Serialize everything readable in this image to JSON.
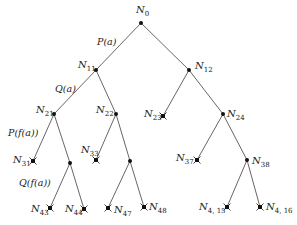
{
  "nodes": [
    {
      "id": "N0",
      "name": "N",
      "sub": "0",
      "x": 141,
      "y": 23,
      "type": "internal",
      "lx": 136,
      "ly": 13,
      "anchor": "middle"
    },
    {
      "id": "N11",
      "name": "N",
      "sub": "11",
      "x": 96,
      "y": 70,
      "type": "internal",
      "lx": 78,
      "ly": 68,
      "anchor": "start"
    },
    {
      "id": "N12",
      "name": "N",
      "sub": "12",
      "x": 189,
      "y": 70,
      "type": "internal",
      "lx": 195,
      "ly": 69,
      "anchor": "start"
    },
    {
      "id": "N21",
      "name": "N",
      "sub": "21",
      "x": 54,
      "y": 114,
      "type": "internal",
      "lx": 36,
      "ly": 113,
      "anchor": "start"
    },
    {
      "id": "N22",
      "name": "N",
      "sub": "22",
      "x": 116,
      "y": 114,
      "type": "internal",
      "lx": 96,
      "ly": 113,
      "anchor": "start"
    },
    {
      "id": "N23",
      "name": "N",
      "sub": "23",
      "x": 163,
      "y": 116,
      "type": "failure",
      "lx": 144,
      "ly": 117,
      "anchor": "start"
    },
    {
      "id": "N24",
      "name": "N",
      "sub": "24",
      "x": 223,
      "y": 114,
      "type": "internal",
      "lx": 227,
      "ly": 117,
      "anchor": "start"
    },
    {
      "id": "N31",
      "name": "N",
      "sub": "31",
      "x": 33,
      "y": 161,
      "type": "failure",
      "lx": 13,
      "ly": 163,
      "anchor": "start"
    },
    {
      "id": "N32",
      "name": "",
      "sub": "",
      "x": 70,
      "y": 163,
      "type": "internal",
      "lx": 0,
      "ly": 0,
      "anchor": "start"
    },
    {
      "id": "N33",
      "name": "N",
      "sub": "33",
      "x": 96,
      "y": 160,
      "type": "failure",
      "lx": 81,
      "ly": 153,
      "anchor": "start"
    },
    {
      "id": "N34",
      "name": "",
      "sub": "",
      "x": 130,
      "y": 161,
      "type": "internal",
      "lx": 0,
      "ly": 0,
      "anchor": "start"
    },
    {
      "id": "N37",
      "name": "N",
      "sub": "37",
      "x": 197,
      "y": 160,
      "type": "failure",
      "lx": 176,
      "ly": 161,
      "anchor": "start"
    },
    {
      "id": "N38",
      "name": "N",
      "sub": "38",
      "x": 247,
      "y": 160,
      "type": "internal",
      "lx": 252,
      "ly": 164,
      "anchor": "start"
    },
    {
      "id": "N43",
      "name": "N",
      "sub": "43",
      "x": 50,
      "y": 208,
      "type": "failure",
      "lx": 31,
      "ly": 212,
      "anchor": "start"
    },
    {
      "id": "N44",
      "name": "N",
      "sub": "44",
      "x": 84,
      "y": 209,
      "type": "failure",
      "lx": 65,
      "ly": 212,
      "anchor": "start"
    },
    {
      "id": "N47",
      "name": "N",
      "sub": "47",
      "x": 108,
      "y": 208,
      "type": "failure",
      "lx": 114,
      "ly": 213,
      "anchor": "start"
    },
    {
      "id": "N48",
      "name": "N",
      "sub": "48",
      "x": 144,
      "y": 207,
      "type": "failure",
      "lx": 149,
      "ly": 210,
      "anchor": "start"
    },
    {
      "id": "N415",
      "name": "N",
      "sub": "4, 15",
      "x": 227,
      "y": 207,
      "type": "failure",
      "lx": 199,
      "ly": 210,
      "anchor": "start"
    },
    {
      "id": "N416",
      "name": "N",
      "sub": "4, 16",
      "x": 260,
      "y": 207,
      "type": "failure",
      "lx": 266,
      "ly": 210,
      "anchor": "start"
    }
  ],
  "edges": [
    {
      "from": "N0",
      "to": "N11"
    },
    {
      "from": "N0",
      "to": "N12"
    },
    {
      "from": "N11",
      "to": "N21"
    },
    {
      "from": "N11",
      "to": "N22"
    },
    {
      "from": "N12",
      "to": "N23"
    },
    {
      "from": "N12",
      "to": "N24"
    },
    {
      "from": "N21",
      "to": "N31"
    },
    {
      "from": "N21",
      "to": "N32"
    },
    {
      "from": "N22",
      "to": "N33"
    },
    {
      "from": "N22",
      "to": "N34"
    },
    {
      "from": "N24",
      "to": "N37"
    },
    {
      "from": "N24",
      "to": "N38"
    },
    {
      "from": "N32",
      "to": "N43"
    },
    {
      "from": "N32",
      "to": "N44"
    },
    {
      "from": "N34",
      "to": "N47"
    },
    {
      "from": "N34",
      "to": "N48"
    },
    {
      "from": "N38",
      "to": "N415"
    },
    {
      "from": "N38",
      "to": "N416"
    }
  ],
  "edge_labels": [
    {
      "text": "P(a)",
      "x": 97,
      "y": 45
    },
    {
      "text": "Q(a)",
      "x": 55,
      "y": 92
    },
    {
      "text": "P(f(a))",
      "x": 8,
      "y": 136
    },
    {
      "text": "Q(f(a))",
      "x": 19,
      "y": 186
    }
  ],
  "colors": {
    "edge": "#555555",
    "node": "#111111",
    "text": "#222222",
    "background": "#ffffff"
  }
}
